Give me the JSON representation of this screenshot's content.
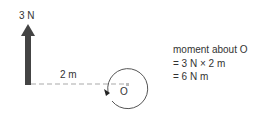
{
  "diagram": {
    "force_label": "3 N",
    "distance_label": "2 m",
    "pivot_label": "O",
    "explanation": {
      "line1": "moment about O",
      "line2": "= 3 N × 2 m",
      "line3": "= 6 N m"
    },
    "colors": {
      "arrow": "#444444",
      "dashed_line": "#aaaaaa",
      "circle": "#555555",
      "text": "#333333"
    }
  }
}
